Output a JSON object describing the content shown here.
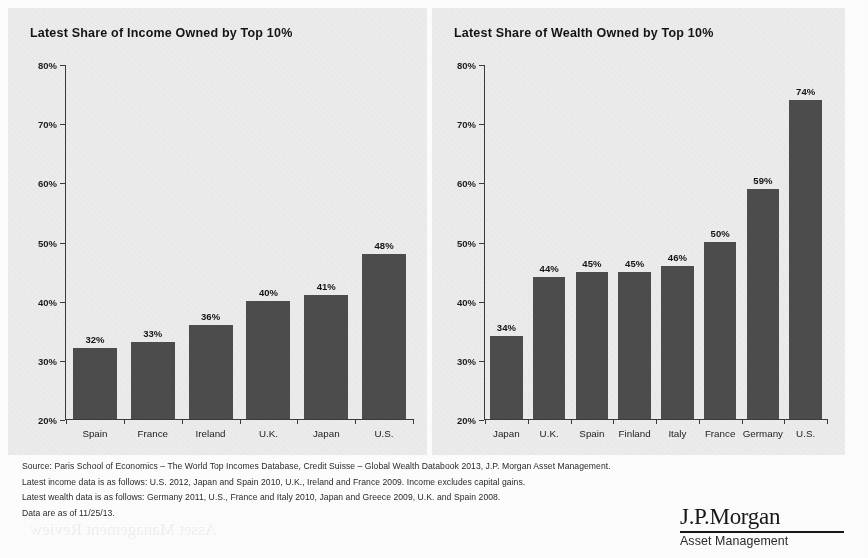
{
  "charts": [
    {
      "id": "income",
      "title": "Latest Share of Income Owned by Top 10%",
      "chart_data": {
        "type": "bar",
        "title": "Latest Share of Income Owned by Top 10%",
        "categories": [
          "Spain",
          "France",
          "Ireland",
          "U.K.",
          "Japan",
          "U.S."
        ],
        "values": [
          32,
          33,
          36,
          40,
          41,
          48
        ],
        "value_labels": [
          "32%",
          "33%",
          "36%",
          "40%",
          "41%",
          "48%"
        ],
        "xlabel": "",
        "ylabel": "",
        "ylim": [
          20,
          80
        ],
        "ytick_labels": [
          "20%",
          "30%",
          "40%",
          "50%",
          "60%",
          "70%",
          "80%"
        ],
        "ytick_values": [
          20,
          30,
          40,
          50,
          60,
          70,
          80
        ],
        "grid": false,
        "legend": "none",
        "bar_color": "#4d4d4d"
      }
    },
    {
      "id": "wealth",
      "title": "Latest Share of Wealth Owned by Top 10%",
      "chart_data": {
        "type": "bar",
        "title": "Latest Share of Wealth Owned by Top 10%",
        "categories": [
          "Japan",
          "U.K.",
          "Spain",
          "Finland",
          "Italy",
          "France",
          "Germany",
          "U.S."
        ],
        "values": [
          34,
          44,
          45,
          45,
          46,
          50,
          59,
          74
        ],
        "value_labels": [
          "34%",
          "44%",
          "45%",
          "45%",
          "46%",
          "50%",
          "59%",
          "74%"
        ],
        "xlabel": "",
        "ylabel": "",
        "ylim": [
          20,
          80
        ],
        "ytick_labels": [
          "20%",
          "30%",
          "40%",
          "50%",
          "60%",
          "70%",
          "80%"
        ],
        "ytick_values": [
          20,
          30,
          40,
          50,
          60,
          70,
          80
        ],
        "grid": false,
        "legend": "none",
        "bar_color": "#4d4d4d"
      }
    }
  ],
  "footnotes": [
    "Source: Paris School of Economics – The World Top Incomes Database, Credit Suisse – Global Wealth Databook 2013, J.P. Morgan Asset Management.",
    "Latest income data is as follows: U.S. 2012, Japan and Spain 2010, U.K., Ireland and France 2009. Income excludes capital gains.",
    "Latest wealth data is as follows: Germany 2011, U.S., France and Italy 2010, Japan and Greece 2009, U.K. and Spain 2008.",
    "Data are as of 11/25/13."
  ],
  "logo": {
    "brand": "J.P.Morgan",
    "tagline": "Asset Management"
  },
  "colors": {
    "bar": "#4d4d4d",
    "panel_background": "#efefef",
    "page_background": "#ffffff",
    "axis": "#3b3b3b",
    "text": "#1a1a1a"
  }
}
